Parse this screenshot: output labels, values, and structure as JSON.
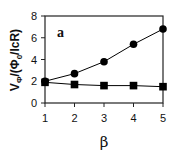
{
  "chart_data": {
    "type": "line",
    "title": "",
    "panel_label": "a",
    "xlabel": "β",
    "ylabel": "VΦ/(Φ0/IcR)",
    "ylabel_parts": {
      "main": "V",
      "sub": "Φ",
      "rest": "/(Φ",
      "sub2": "0",
      "rest2": "/IcR)"
    },
    "x": [
      1,
      2,
      3,
      4,
      5
    ],
    "xlim": [
      1,
      5
    ],
    "ylim": [
      0,
      8
    ],
    "xticks": [
      1,
      2,
      3,
      4,
      5
    ],
    "yticks": [
      0,
      2,
      4,
      6,
      8
    ],
    "grid": false,
    "legend": "none",
    "series": [
      {
        "name": "circles",
        "marker": "circle",
        "color": "#000000",
        "values": [
          2.0,
          2.7,
          3.8,
          5.4,
          6.8
        ]
      },
      {
        "name": "squares",
        "marker": "square",
        "color": "#000000",
        "values": [
          1.9,
          1.7,
          1.6,
          1.6,
          1.5
        ]
      }
    ]
  }
}
